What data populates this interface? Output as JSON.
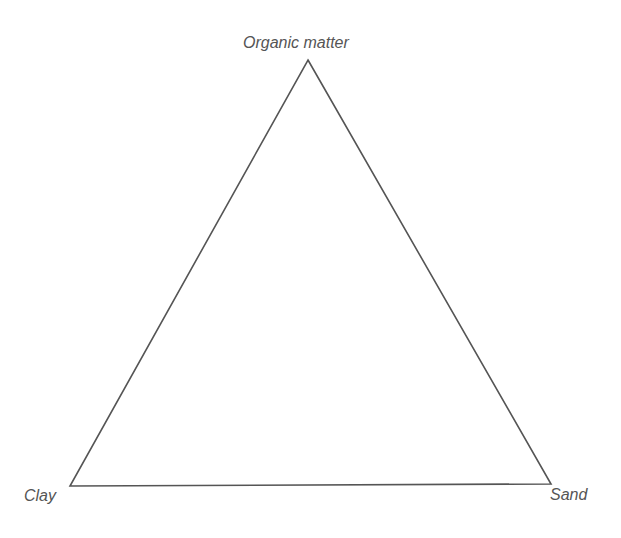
{
  "diagram": {
    "type": "ternary-triangle",
    "vertices": {
      "top": {
        "label": "Organic matter",
        "x": 308,
        "y": 60
      },
      "bottom_left": {
        "label": "Clay",
        "x": 70,
        "y": 486
      },
      "bottom_right": {
        "label": "Sand",
        "x": 551,
        "y": 484
      }
    },
    "stroke_color": "#555555",
    "stroke_width": 1.6,
    "fill": "none"
  }
}
